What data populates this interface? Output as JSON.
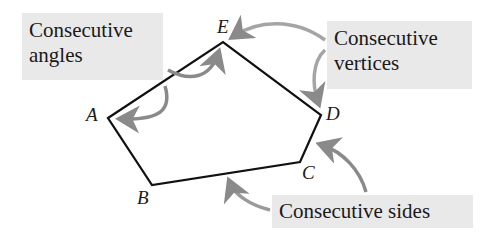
{
  "labels": {
    "angles": {
      "line1": "Consecutive",
      "line2": "angles"
    },
    "vertices": {
      "line1": "Consecutive",
      "line2": "vertices"
    },
    "sides": {
      "text": "Consecutive sides"
    }
  },
  "vertices": {
    "A": "A",
    "B": "B",
    "C": "C",
    "D": "D",
    "E": "E"
  },
  "colors": {
    "polygon": "#111111",
    "arrow": "#8a8a8a",
    "label_bg": "#e9e9e9"
  }
}
